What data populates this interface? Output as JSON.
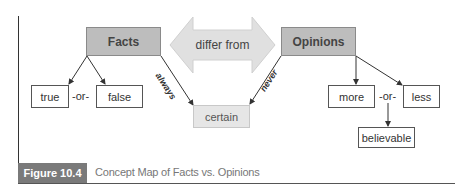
{
  "diagram": {
    "nodes": {
      "facts": "Facts",
      "opinions": "Opinions",
      "differ": "differ from",
      "true": "true",
      "false": "false",
      "certain": "certain",
      "more": "more",
      "less": "less",
      "believable": "believable"
    },
    "connectors": {
      "or_left": "-or-",
      "or_right": "-or-"
    },
    "edge_labels": {
      "always": "always",
      "never": "never"
    }
  },
  "caption": {
    "figure_label": "Figure 10.4",
    "title": "Concept Map of Facts vs. Opinions"
  },
  "colors": {
    "main_node": "#bdbdbd",
    "arrow_fill": "#e0e0e0",
    "caption_tab": "#7a7a7a"
  }
}
